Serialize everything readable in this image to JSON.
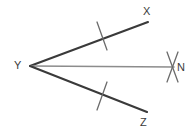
{
  "figure": {
    "background_color": "#ffffff",
    "width": 196,
    "height": 136,
    "ray_color": "#3a3a3a",
    "bisector_color": "#8c8c8c",
    "tick_color": "#6b6b6b",
    "label_color": "#3a3a3a"
  },
  "labels": {
    "x": "X",
    "y": "Y",
    "n": "N",
    "z": "Z"
  },
  "points": {
    "vertex_y": {
      "x": 30,
      "y": 66
    },
    "end_x": {
      "x": 148,
      "y": 22
    },
    "end_n": {
      "x": 174,
      "y": 67
    },
    "end_z": {
      "x": 147,
      "y": 112
    }
  },
  "segments": [
    {
      "name": "ray-yx",
      "from": "vertex_y",
      "to": "end_x",
      "stroke": "#3a3a3a",
      "width": 2.1
    },
    {
      "name": "ray-yn",
      "from": "vertex_y",
      "to": "end_n",
      "stroke": "#8c8c8c",
      "width": 1.6
    },
    {
      "name": "ray-yz",
      "from": "vertex_y",
      "to": "end_z",
      "stroke": "#3a3a3a",
      "width": 2.1
    }
  ],
  "tick_marks": [
    {
      "name": "tick-on-yx",
      "count": 1,
      "center_x": 102,
      "center_y": 36
    },
    {
      "name": "tick-on-yz",
      "count": 1,
      "center_x": 102,
      "center_y": 96
    },
    {
      "name": "tick-on-yn",
      "count": 2,
      "center_x": 172,
      "center_y": 67
    }
  ]
}
